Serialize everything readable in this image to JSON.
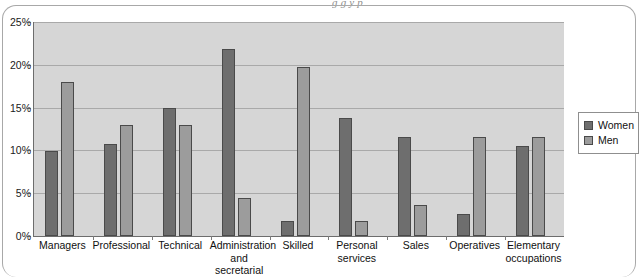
{
  "page": {
    "caption_fragment": "g g y p"
  },
  "legend": {
    "position": "right",
    "items": [
      {
        "label": "Women",
        "color": "#6e6e6e",
        "swatch_name": "legend-swatch-women"
      },
      {
        "label": "Men",
        "color": "#9c9c9c",
        "swatch_name": "legend-swatch-men"
      }
    ]
  },
  "axes": {
    "y_ticks": [
      "0%",
      "5%",
      "10%",
      "15%",
      "20%",
      "25%"
    ],
    "y_min": 0,
    "y_max": 25,
    "y_step": 5
  },
  "chart_data": {
    "type": "bar",
    "title": "",
    "subtitle": "",
    "xlabel": "",
    "ylabel": "",
    "ylim": [
      0,
      25
    ],
    "ytick_values": [
      0,
      5,
      10,
      15,
      20,
      25
    ],
    "ytick_labels": [
      "0%",
      "5%",
      "10%",
      "15%",
      "20%",
      "25%"
    ],
    "grid": true,
    "grid_axis": "y",
    "legend_position": "right",
    "units": "percent",
    "categories": [
      "Managers",
      "Professional",
      "Technical",
      "Administration and secretarial",
      "Skilled",
      "Personal services",
      "Sales",
      "Operatives",
      "Elementary occupations"
    ],
    "category_lines": [
      [
        "Managers",
        ""
      ],
      [
        "Professional",
        ""
      ],
      [
        "Technical",
        ""
      ],
      [
        "Administration",
        "and secretarial"
      ],
      [
        "Skilled",
        ""
      ],
      [
        "Personal",
        "services"
      ],
      [
        "Sales",
        ""
      ],
      [
        "Operatives",
        ""
      ],
      [
        "Elementary",
        "occupations"
      ]
    ],
    "series": [
      {
        "name": "Women",
        "color": "#6e6e6e",
        "values": [
          9.9,
          10.8,
          14.9,
          21.9,
          1.8,
          13.8,
          11.6,
          2.6,
          10.5
        ]
      },
      {
        "name": "Men",
        "color": "#9c9c9c",
        "values": [
          18.0,
          13.0,
          13.0,
          4.4,
          19.8,
          1.7,
          3.6,
          11.6,
          11.6
        ]
      }
    ]
  },
  "colors": {
    "plot_background": "#d6d6d6",
    "gridline": "#a9a9a9",
    "axis": "#6d6d6d",
    "women": "#6e6e6e",
    "men": "#9c9c9c",
    "page_background": "#ffffff"
  }
}
